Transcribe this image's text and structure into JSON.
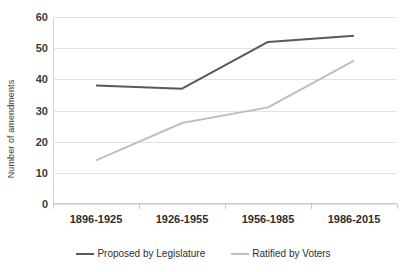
{
  "chart_data": {
    "type": "line",
    "title": "",
    "xlabel": "",
    "ylabel": "Number of amendments",
    "categories": [
      "1896-1925",
      "1926-1955",
      "1956-1985",
      "1986-2015"
    ],
    "series": [
      {
        "name": "Proposed by Legislature",
        "color": "#595959",
        "values": [
          38,
          37,
          52,
          54
        ]
      },
      {
        "name": "Ratified by Voters",
        "color": "#bfbfbf",
        "values": [
          14,
          26,
          31,
          46
        ]
      }
    ],
    "ylim": [
      0,
      60
    ],
    "y_ticks": [
      0,
      10,
      20,
      30,
      40,
      50,
      60
    ],
    "y_tick_labels": [
      "0",
      "10",
      "20",
      "30",
      "40",
      "50",
      "60"
    ],
    "grid": "horizontal",
    "legend_position": "bottom"
  }
}
